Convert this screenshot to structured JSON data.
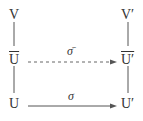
{
  "diagram": {
    "type": "commutative-diagram",
    "nodes": {
      "v": "V",
      "ubar": "U",
      "u": "U",
      "v_prime": "V′",
      "ubar_prime": "U′",
      "u_prime": "U′"
    },
    "arrows": {
      "sigma_bar": {
        "label": "σ̄",
        "from": "Ū",
        "to": "Ū′",
        "style": "dashed"
      },
      "sigma": {
        "label": "σ",
        "from": "U",
        "to": "U′",
        "style": "solid"
      }
    },
    "edges": [
      {
        "from": "V",
        "to": "Ū",
        "style": "line"
      },
      {
        "from": "Ū",
        "to": "U",
        "style": "line"
      },
      {
        "from": "V′",
        "to": "Ū′",
        "style": "line"
      },
      {
        "from": "Ū′",
        "to": "U′",
        "style": "line"
      }
    ]
  }
}
